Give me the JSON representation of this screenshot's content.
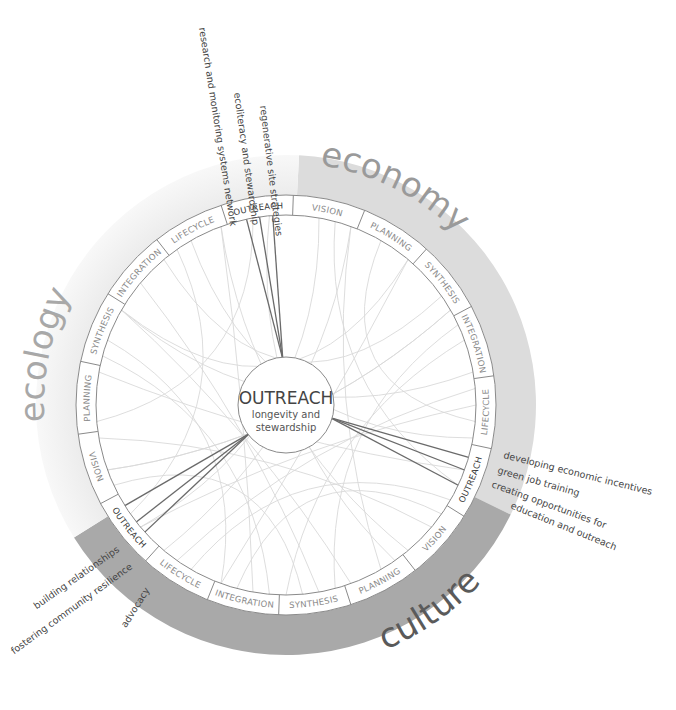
{
  "center": {
    "title": "OUTREACH",
    "subtitle_line1": "longevity and",
    "subtitle_line2": "stewardship"
  },
  "sectors": [
    {
      "name": "economy",
      "label": "economy",
      "color": "#dcdcdc",
      "text_color": "#9a9a9a"
    },
    {
      "name": "culture",
      "label": "culture",
      "color": "#a9a9a9",
      "text_color": "#5a5a5a"
    },
    {
      "name": "ecology",
      "label": "ecology",
      "color": "#f1f1f1",
      "text_color": "#a8a8a8"
    }
  ],
  "ring_segments": [
    {
      "label": "OUTREACH",
      "active": true
    },
    {
      "label": "VISION",
      "active": false
    },
    {
      "label": "PLANNING",
      "active": false
    },
    {
      "label": "SYNTHESIS",
      "active": false
    },
    {
      "label": "INTEGRATION",
      "active": false
    },
    {
      "label": "LIFECYCLE",
      "active": false
    },
    {
      "label": "OUTREACH",
      "active": true
    },
    {
      "label": "VISION",
      "active": false
    },
    {
      "label": "PLANNING",
      "active": false
    },
    {
      "label": "SYNTHESIS",
      "active": false
    },
    {
      "label": "INTEGRATION",
      "active": false
    },
    {
      "label": "LIFECYCLE",
      "active": false
    },
    {
      "label": "OUTREACH",
      "active": true
    },
    {
      "label": "VISION",
      "active": false
    },
    {
      "label": "PLANNING",
      "active": false
    },
    {
      "label": "SYNTHESIS",
      "active": false
    },
    {
      "label": "INTEGRATION",
      "active": false
    },
    {
      "label": "LIFECYCLE",
      "active": false
    }
  ],
  "annotations": {
    "economy": [
      "research and monitoring systems network",
      "ecoliteracy and stewardship",
      "regenerative site strategies"
    ],
    "culture": [
      "developing economic incentives",
      "green job training",
      "creating opportunities for",
      "education and outreach"
    ],
    "ecology": [
      "building relationships",
      "fostering community resilience",
      "advocacy"
    ]
  }
}
